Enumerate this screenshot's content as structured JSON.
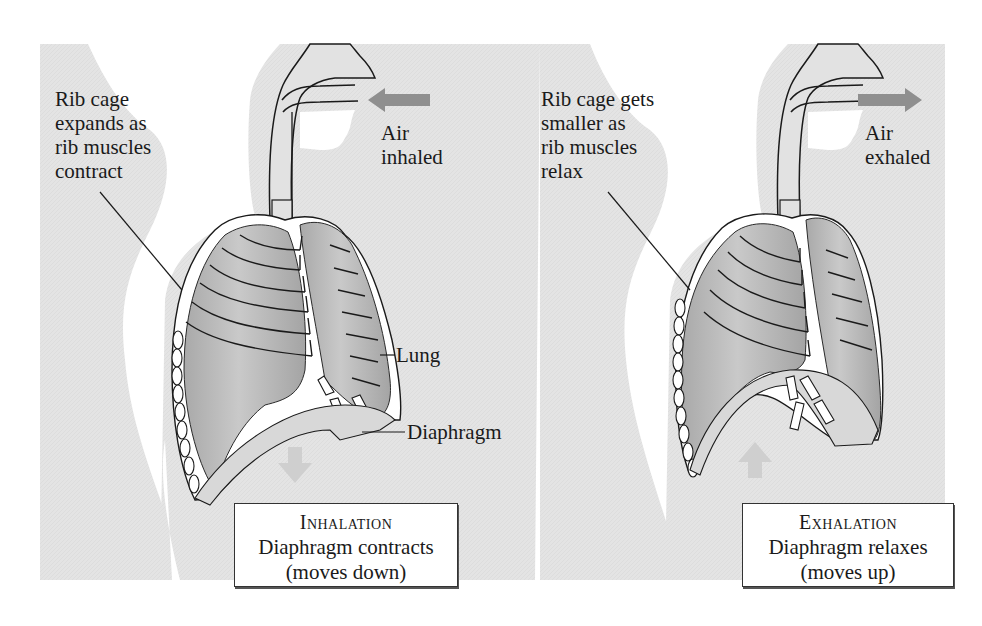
{
  "figure": {
    "colors": {
      "background": "#ffffff",
      "body_silhouette": "#e6e6e6",
      "lung_fill": "#b3b3b3",
      "lung_highlight": "#d2d2d2",
      "airway_fill": "#e2e2e2",
      "outline": "#1a1a1a",
      "arrow": "#8f8f8f",
      "diaphragm_arrow": "#cfcfcf"
    }
  },
  "panels": [
    {
      "id": "inhalation",
      "rib_label": "Rib cage\nexpands as\nrib muscles\ncontract",
      "air_label": "Air\ninhaled",
      "air_arrow_direction": "left",
      "diaphragm_arrow_direction": "down",
      "caption_title": "Inhalation",
      "caption_line1": "Diaphragm contracts",
      "caption_line2": "(moves down)",
      "callouts": {
        "lung": "Lung",
        "diaphragm": "Diaphragm"
      }
    },
    {
      "id": "exhalation",
      "rib_label": "Rib cage gets\nsmaller as\nrib muscles\nrelax",
      "air_label": "Air\nexhaled",
      "air_arrow_direction": "right",
      "diaphragm_arrow_direction": "up",
      "caption_title": "Exhalation",
      "caption_line1": "Diaphragm relaxes",
      "caption_line2": "(moves up)"
    }
  ]
}
